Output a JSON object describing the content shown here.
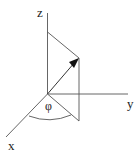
{
  "diagram": {
    "type": "3d-coordinate-system",
    "labels": {
      "z_axis": "z",
      "y_axis": "y",
      "x_axis": "x",
      "angle": "φ"
    },
    "colors": {
      "line": "#555555",
      "arrow": "#111111",
      "background": "#ffffff"
    }
  }
}
